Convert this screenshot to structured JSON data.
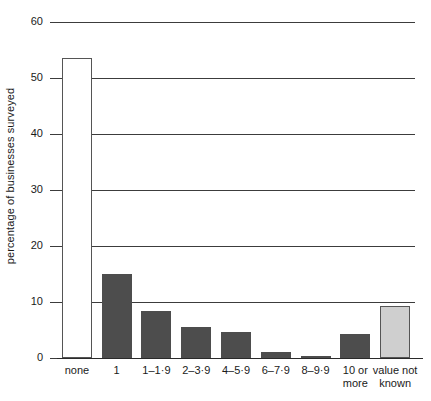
{
  "chart_data": {
    "type": "bar",
    "title": "",
    "xlabel": "",
    "ylabel": "percentage of businesses surveyed",
    "ylim": [
      0,
      60
    ],
    "yticks": [
      0,
      10,
      20,
      30,
      40,
      50,
      60
    ],
    "ytick_labels": [
      "0",
      "10",
      "20",
      "30",
      "40",
      "50",
      "60"
    ],
    "grid": true,
    "legend": "none",
    "categories": [
      "none",
      "1",
      "1–1·9",
      "2–3·9",
      "4–5·9",
      "6–7·9",
      "8–9·9",
      "10 or more",
      "value not known"
    ],
    "category_lines": [
      [
        "none"
      ],
      [
        "1"
      ],
      [
        "1–1·9"
      ],
      [
        "2–3·9"
      ],
      [
        "4–5·9"
      ],
      [
        "6–7·9"
      ],
      [
        "8–9·9"
      ],
      [
        "10 or",
        "more"
      ],
      [
        "value not",
        "known"
      ]
    ],
    "values": [
      53.5,
      15.0,
      8.4,
      5.6,
      4.6,
      1.0,
      0.3,
      4.2,
      9.2
    ],
    "bar_styles": [
      "outline",
      "solid",
      "solid",
      "solid",
      "solid",
      "solid",
      "solid",
      "solid",
      "light"
    ],
    "colors": {
      "bar_solid": "#4d4d4d",
      "bar_light_fill": "#cfcfcf",
      "bar_outline_fill": "#ffffff",
      "bar_border": "#555555",
      "gridline": "#3c3c3c",
      "axis": "#2a2a2a",
      "text": "#1a1a1a",
      "background": "#ffffff"
    }
  }
}
